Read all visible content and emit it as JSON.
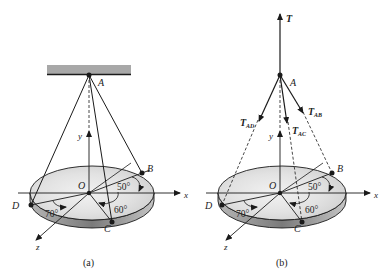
{
  "figure_a": {
    "caption": "(a)",
    "points": {
      "A": "A",
      "B": "B",
      "C": "C",
      "D": "D",
      "O": "O"
    },
    "axes": {
      "x": "x",
      "y": "y",
      "z": "z"
    },
    "angles": {
      "AB": "50°",
      "AC": "60°",
      "AD": "70°"
    }
  },
  "figure_b": {
    "caption": "(b)",
    "points": {
      "A": "A",
      "B": "B",
      "C": "C",
      "D": "D",
      "O": "O"
    },
    "axes": {
      "x": "x",
      "y": "y",
      "z": "z"
    },
    "angles": {
      "AB": "50°",
      "AC": "60°",
      "AD": "70°"
    },
    "forces": {
      "T": "T",
      "TAB_main": "T",
      "TAB_sub": "AB",
      "TAC_main": "T",
      "TAC_sub": "AC",
      "TAD_main": "T",
      "TAD_sub": "AD"
    }
  },
  "colors": {
    "line": "#1a1a1a",
    "ceiling": "#a8a8a8",
    "disk_top": "#e6e6e6",
    "disk_side": "#8a8a8a"
  }
}
